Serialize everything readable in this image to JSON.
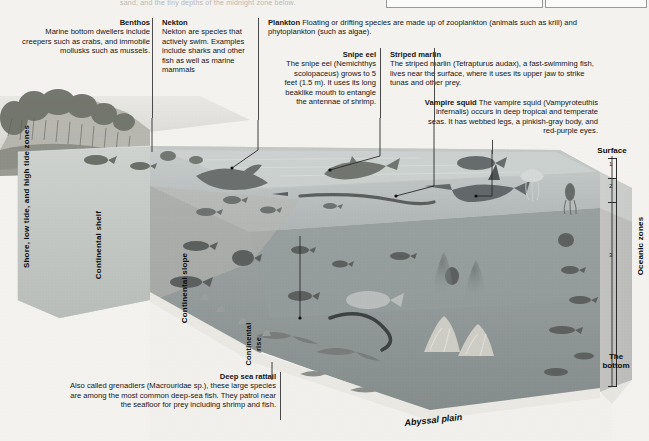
{
  "meta": {
    "top_cut_text": "sand, and the tiny depths of the midnight zone below."
  },
  "callouts": [
    {
      "id": "benthos",
      "title": "Benthos",
      "body": "Marine bottom dwellers include creepers such as crabs, and immobile mollusks such as mussels."
    },
    {
      "id": "nekton",
      "title": "Nekton",
      "body": "Nekton are species that actively swim. Examples include sharks and other fish as well as marine mammals"
    },
    {
      "id": "plankton",
      "title": "Plankton",
      "body": "Floating or drifting species are made up of zooplankton (animals such as krill) and phytoplankton (such as algae)."
    },
    {
      "id": "snipe-eel",
      "title": "Snipe eel",
      "body": "The snipe eel (Nemichthys scolopaceus) grows to 5 feet (1.5 m). It uses its long beaklike mouth to entangle the antennae of shrimp."
    },
    {
      "id": "striped-marlin",
      "title": "Striped marlin",
      "body": "The striped marlin (Tetrapturus audax), a fast-swimming fish, lives near the surface, where it uses its upper jaw to strike tunas and other prey."
    },
    {
      "id": "vampire-squid",
      "title": "Vampire squid",
      "body": "The vampire squid (Vampyroteuthis infernalis) occurs in deep tropical and temperate seas. It has webbed legs, a pinkish-gray body, and red-purple eyes."
    },
    {
      "id": "deep-sea-rattail",
      "title": "Deep sea rattail",
      "body": "Also called grenadiers (Macrouridae sp.), these large species are among the most common deep-sea fish. They patrol near the seafloor for prey including shrimp and fish."
    }
  ],
  "feature_labels": {
    "shore_zones": "Shore, low tide, and high tide zones",
    "continental_shelf": "Continental shelf",
    "continental_slope": "Continental slope",
    "continental_rise_line1": "Continental",
    "continental_rise_line2": "rise",
    "abyssal_plain": "Abyssal plain"
  },
  "zone_scale": {
    "surface_label": "Surface",
    "bottom_label_line1": "The",
    "bottom_label_line2": "bottom",
    "axis_title": "Oceanic zones",
    "zone_numbers": [
      "1",
      "2",
      "3"
    ]
  },
  "colors": {
    "page_bg": "#f3f2ef",
    "water_upper": "#b9bdbc",
    "water_mid": "#9aa0a0",
    "water_deep": "#8d9494",
    "block_face_light": "#cfcfca",
    "block_face_mid": "#c2c2bd",
    "block_top": "#dcdcd7",
    "ink": "#161616",
    "rule": "#4a4a4a"
  }
}
